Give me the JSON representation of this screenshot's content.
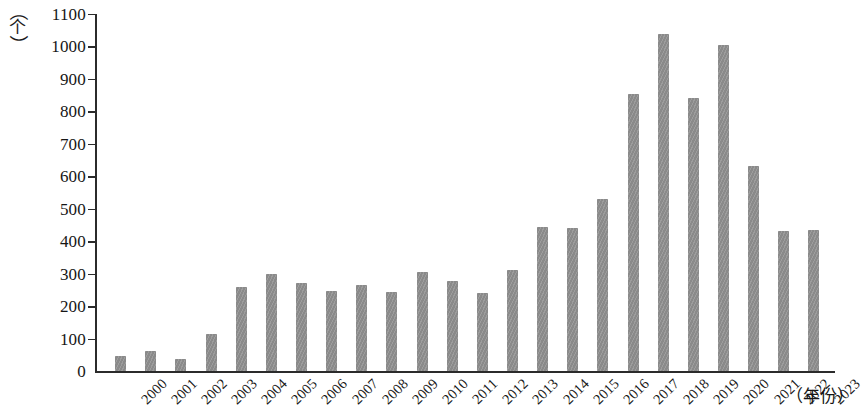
{
  "chart_data": {
    "type": "bar",
    "title": "",
    "xlabel": "（年份）",
    "ylabel": "（个）",
    "ylim": [
      0,
      1100
    ],
    "ytick_step": 100,
    "grid": false,
    "legend": null,
    "bar_color": "#8a8a8a",
    "axis_color": "#2b2b2b",
    "categories": [
      "2000",
      "2001",
      "2002",
      "2003",
      "2004",
      "2005",
      "2006",
      "2007",
      "2008",
      "2009",
      "2010",
      "2011",
      "2012",
      "2013",
      "2014",
      "2015",
      "2016",
      "2017",
      "2018",
      "2019",
      "2020",
      "2021",
      "2022",
      "2023"
    ],
    "values": [
      48,
      62,
      38,
      115,
      258,
      300,
      272,
      247,
      266,
      243,
      305,
      277,
      242,
      312,
      444,
      442,
      529,
      853,
      1038,
      842,
      1006,
      632,
      432,
      436
    ],
    "ytick_labels": [
      "0",
      "100",
      "200",
      "300",
      "400",
      "500",
      "600",
      "700",
      "800",
      "900",
      "1000",
      "1100"
    ],
    "ytick_values": [
      0,
      100,
      200,
      300,
      400,
      500,
      600,
      700,
      800,
      900,
      1000,
      1100
    ]
  },
  "axis": {
    "y_unit_paren_open": "︵",
    "y_unit_char": "个",
    "y_unit_paren_close": "︶",
    "x_title": "（年份）"
  }
}
